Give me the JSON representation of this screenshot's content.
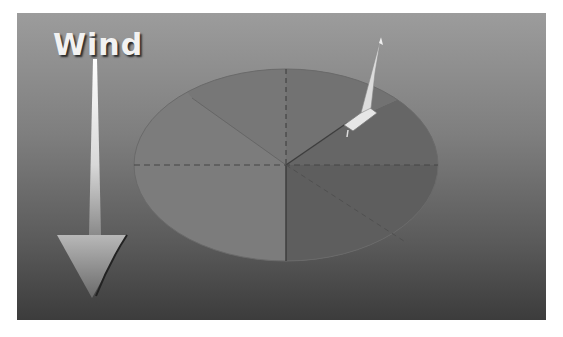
{
  "diagram": {
    "title_label": "Wind",
    "elements": {
      "wind_arrow": {
        "direction": "down",
        "icon": "arrow-down-icon"
      },
      "circle": {
        "sectors": [
          "left-half",
          "upper-right",
          "lower-right"
        ]
      },
      "boat": {
        "icon": "sailboat-icon",
        "position": "upper-right edge of circle"
      }
    },
    "colors": {
      "background_top": "#9c9c9c",
      "background_bottom": "#3c3c3c",
      "sector_left": "#7c7c7c",
      "sector_upper_right": "#6e6e6e",
      "sector_lower_right": "#5e5e5e",
      "arrow": "#f0f0f0",
      "text": "#f2f2f2"
    }
  }
}
